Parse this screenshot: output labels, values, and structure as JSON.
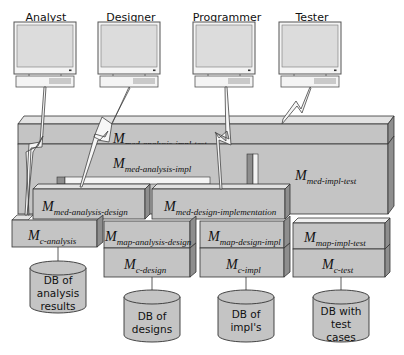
{
  "roles": [
    {
      "id": "analyst",
      "label": "Analyst"
    },
    {
      "id": "designer",
      "label": "Designer"
    },
    {
      "id": "programmer",
      "label": "Programmer"
    },
    {
      "id": "tester",
      "label": "Tester"
    }
  ],
  "components": {
    "med_analysis_impl_test": {
      "main": "M",
      "sub": "med-analysis-impl-test"
    },
    "med_analysis_impl": {
      "main": "M",
      "sub": "med-analysis-impl"
    },
    "med_impl_test": {
      "main": "M",
      "sub": "med-impl-test"
    },
    "med_analysis_design": {
      "main": "M",
      "sub": "med-analysis-design"
    },
    "med_design_implementation": {
      "main": "M",
      "sub": "med-design-implementation"
    },
    "c_analysis": {
      "main": "M",
      "sub": "c-analysis"
    },
    "map_analysis_design": {
      "main": "M",
      "sub": "map-analysis-design"
    },
    "c_design": {
      "main": "M",
      "sub": "c-design"
    },
    "map_design_impl": {
      "main": "M",
      "sub": "map-design-impl"
    },
    "c_impl": {
      "main": "M",
      "sub": "c-impl"
    },
    "map_impl_test": {
      "main": "M",
      "sub": "map-impl-test"
    },
    "c_test": {
      "main": "M",
      "sub": "c-test"
    }
  },
  "databases": [
    {
      "id": "analysis",
      "lines": [
        "DB of",
        "analysis",
        "results"
      ]
    },
    {
      "id": "designs",
      "lines": [
        "DB of",
        "designs"
      ]
    },
    {
      "id": "impls",
      "lines": [
        "DB of",
        "impl's"
      ]
    },
    {
      "id": "tests",
      "lines": [
        "DB with",
        "test",
        "cases"
      ]
    }
  ],
  "colors": {
    "box_front": "#c4c4c4",
    "box_top": "#e2e2e2",
    "box_side": "#8e8e8e",
    "outline": "#333333",
    "monitor_screen": "#dcdcdc"
  }
}
